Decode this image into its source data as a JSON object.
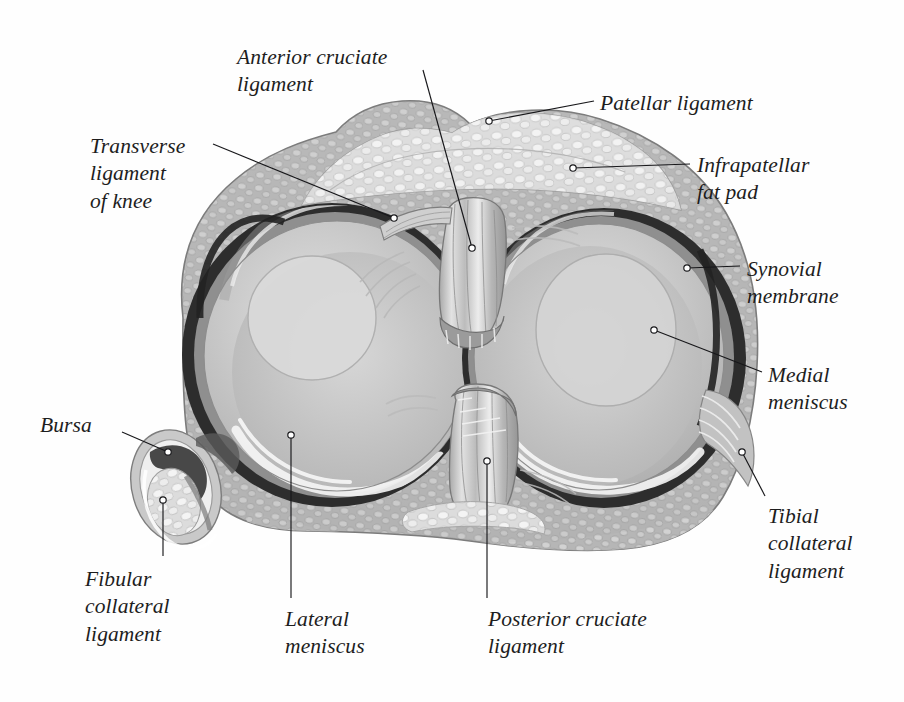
{
  "page": {
    "headline_partial": "Diagram of the knee joint menisci and ligaments",
    "background_color": "#ffffff",
    "text_color": "#1d1d1d",
    "leader_color": "#17171a"
  },
  "illustration": {
    "name": "knee-joint-superior-view",
    "description": "Grayscale anatomical drawing: superior view of the right tibial plateau showing both menisci, cruciate ligaments, synovial membrane, fat pad, collateral ligaments and a bursa.",
    "palette": {
      "capsule_fill": "#b9b9b9",
      "capsule_edge": "#8a8a8a",
      "fat_pad_fill": "#e3e3e3",
      "fat_pad_edge": "#9d9d9d",
      "meniscus_fill": "#c8c8c8",
      "meniscus_inner": "#d6d6d6",
      "meniscus_rim_dark": "#2a2a2a",
      "meniscus_highlight": "#f2f2f2",
      "cartilage_shadow": "#9e9e9e",
      "ligament_fill": "#cfcfcf",
      "ligament_stripe": "#efefef",
      "ligament_edge": "#7b7b7b",
      "bursa_dark": "#3c3c3c",
      "outline": "#6e6e6e"
    }
  },
  "labels": [
    {
      "id": "anterior-cruciate-ligament",
      "text": "Anterior cruciate\nligament",
      "position": "top-left",
      "x": 237,
      "y": 44,
      "anchor_x": 472,
      "anchor_y": 248
    },
    {
      "id": "transverse-ligament-of-knee",
      "text": "Transverse\nligament\nof knee",
      "position": "left",
      "x": 90,
      "y": 133,
      "anchor_x": 394,
      "anchor_y": 218
    },
    {
      "id": "patellar-ligament",
      "text": "Patellar ligament",
      "position": "top-right",
      "x": 600,
      "y": 90,
      "anchor_x": 489,
      "anchor_y": 121
    },
    {
      "id": "infrapatellar-fat-pad",
      "text": "Infrapatellar\nfat pad",
      "position": "right",
      "x": 697,
      "y": 152,
      "anchor_x": 573,
      "anchor_y": 168
    },
    {
      "id": "synovial-membrane",
      "text": "Synovial\nmembrane",
      "position": "right",
      "x": 747,
      "y": 256,
      "anchor_x": 687,
      "anchor_y": 268
    },
    {
      "id": "medial-meniscus",
      "text": "Medial\nmeniscus",
      "position": "right",
      "x": 768,
      "y": 362,
      "anchor_x": 654,
      "anchor_y": 330
    },
    {
      "id": "tibial-collateral-ligament",
      "text": "Tibial\ncollateral\nligament",
      "position": "bottom-right",
      "x": 768,
      "y": 503,
      "anchor_x": 742,
      "anchor_y": 452
    },
    {
      "id": "bursa",
      "text": "Bursa",
      "position": "left",
      "x": 40,
      "y": 412,
      "anchor_x": 168,
      "anchor_y": 452
    },
    {
      "id": "fibular-collateral-ligament",
      "text": "Fibular\ncollateral\nligament",
      "position": "bottom-left",
      "x": 85,
      "y": 566,
      "anchor_x": 163,
      "anchor_y": 500
    },
    {
      "id": "lateral-meniscus",
      "text": "Lateral\nmeniscus",
      "position": "bottom-center",
      "x": 285,
      "y": 606,
      "anchor_x": 291,
      "anchor_y": 435
    },
    {
      "id": "posterior-cruciate-ligament",
      "text": "Posterior cruciate\nligament",
      "position": "bottom-center-right",
      "x": 488,
      "y": 606,
      "anchor_x": 487,
      "anchor_y": 461
    }
  ]
}
